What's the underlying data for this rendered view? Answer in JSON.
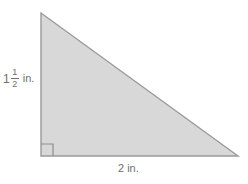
{
  "figure": {
    "name": "right-triangle-diagram",
    "shape": "right triangle",
    "fill_color": "#d8d8d8",
    "stroke_color": "#9a9a9a",
    "background_color": "#ffffff",
    "text_color": "#6f6f6f",
    "vertices": {
      "top": [
        41,
        13
      ],
      "bottom_left": [
        41,
        156
      ],
      "bottom_right": [
        238,
        156
      ]
    },
    "right_angle_marker": {
      "at": "bottom_left",
      "size": 12
    }
  },
  "labels": {
    "height": {
      "whole": "1",
      "numerator": "1",
      "denominator": "2",
      "unit": "in.",
      "full_text": "1 1/2 in."
    },
    "base": {
      "text": "2 in."
    }
  }
}
